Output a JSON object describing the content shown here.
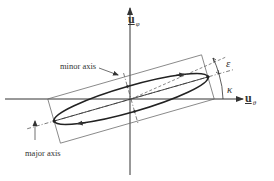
{
  "diagram": {
    "type": "polarization-ellipse",
    "axes": {
      "horizontal": {
        "symbol": "u",
        "subscript": "θ"
      },
      "vertical": {
        "symbol": "u",
        "subscript": "φ"
      }
    },
    "labels": {
      "minor_axis": "minor axis",
      "major_axis": "major axis",
      "epsilon": "ε",
      "kappa": "κ"
    },
    "colors": {
      "line": "#333333",
      "dashed": "#555555",
      "background": "#ffffff"
    }
  }
}
